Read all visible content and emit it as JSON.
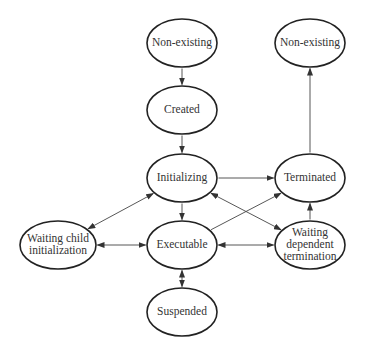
{
  "diagram": {
    "type": "state-transition",
    "nodes": [
      {
        "id": "nonexisting_start",
        "label": [
          "Non-existing"
        ],
        "cx": 182,
        "cy": 43,
        "rx": 35,
        "ry": 24
      },
      {
        "id": "created",
        "label": [
          "Created"
        ],
        "cx": 182,
        "cy": 110,
        "rx": 35,
        "ry": 24
      },
      {
        "id": "initializing",
        "label": [
          "Initializing"
        ],
        "cx": 182,
        "cy": 178,
        "rx": 35,
        "ry": 24
      },
      {
        "id": "executable",
        "label": [
          "Executable"
        ],
        "cx": 182,
        "cy": 245,
        "rx": 35,
        "ry": 24
      },
      {
        "id": "suspended",
        "label": [
          "Suspended"
        ],
        "cx": 182,
        "cy": 312,
        "rx": 35,
        "ry": 24
      },
      {
        "id": "nonexisting_end",
        "label": [
          "Non-existing"
        ],
        "cx": 310,
        "cy": 43,
        "rx": 35,
        "ry": 24
      },
      {
        "id": "terminated",
        "label": [
          "Terminated"
        ],
        "cx": 310,
        "cy": 178,
        "rx": 35,
        "ry": 24
      },
      {
        "id": "waiting_dependent",
        "label": [
          "Waiting",
          "dependent",
          "termination"
        ],
        "cx": 310,
        "cy": 245,
        "rx": 35,
        "ry": 24
      },
      {
        "id": "waiting_child",
        "label": [
          "Waiting child",
          "initialization"
        ],
        "cx": 58,
        "cy": 245,
        "rx": 38,
        "ry": 24
      }
    ],
    "edges": [
      {
        "from": "nonexisting_start",
        "to": "created",
        "bidirectional": false
      },
      {
        "from": "created",
        "to": "initializing",
        "bidirectional": false
      },
      {
        "from": "initializing",
        "to": "executable",
        "bidirectional": false
      },
      {
        "from": "initializing",
        "to": "terminated",
        "bidirectional": false
      },
      {
        "from": "terminated",
        "to": "nonexisting_end",
        "bidirectional": false
      },
      {
        "from": "executable",
        "to": "terminated",
        "bidirectional": false
      },
      {
        "from": "waiting_dependent",
        "to": "terminated",
        "bidirectional": false
      },
      {
        "from": "initializing",
        "to": "waiting_dependent",
        "bidirectional": true
      },
      {
        "from": "executable",
        "to": "waiting_dependent",
        "bidirectional": true
      },
      {
        "from": "executable",
        "to": "waiting_child",
        "bidirectional": true
      },
      {
        "from": "initializing",
        "to": "waiting_child",
        "bidirectional": true
      },
      {
        "from": "executable",
        "to": "suspended",
        "bidirectional": true
      }
    ]
  }
}
